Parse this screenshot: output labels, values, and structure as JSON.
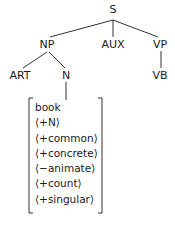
{
  "tree": {
    "root": "S",
    "nodes": {
      "S": "S",
      "NP": "NP",
      "AUX": "AUX",
      "VP": "VP",
      "ART": "ART",
      "N": "N",
      "VB": "VB"
    },
    "edges": [
      [
        "S",
        "NP"
      ],
      [
        "S",
        "AUX"
      ],
      [
        "S",
        "VP"
      ],
      [
        "NP",
        "ART"
      ],
      [
        "NP",
        "N"
      ],
      [
        "VP",
        "VB"
      ],
      [
        "N",
        "feature-matrix"
      ]
    ]
  },
  "feature_matrix": {
    "lexeme": "book",
    "features": [
      "⟨+N⟩",
      "⟨+common⟩",
      "⟨+concrete⟩",
      "⟨−animate⟩",
      "⟨+count⟩",
      "⟨+singular⟩"
    ]
  }
}
